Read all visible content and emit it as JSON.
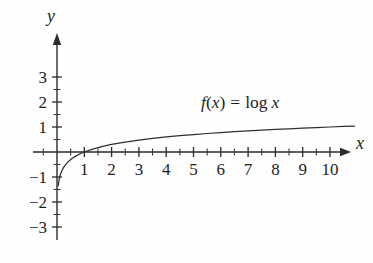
{
  "chart_data": {
    "type": "line",
    "title": "",
    "subtitle": "",
    "function_expression": "f(x) = log x",
    "function_label_parts": {
      "f": "f",
      "open_paren": "(",
      "var_in_paren": "x",
      "close_paren": ")",
      "equals": "=",
      "log": "log",
      "arg": "x"
    },
    "xlabel": "x",
    "ylabel": "y",
    "xlim": [
      -0.9,
      10.9
    ],
    "ylim": [
      -3.35,
      3.4
    ],
    "x_major_ticks": [
      1,
      2,
      3,
      4,
      5,
      6,
      7,
      8,
      9,
      10
    ],
    "x_tick_labels": [
      "1",
      "2",
      "3",
      "4",
      "5",
      "6",
      "7",
      "8",
      "9",
      "10"
    ],
    "x_minor_step": 0.5,
    "y_major_ticks": [
      -3,
      -2,
      -1,
      1,
      2,
      3
    ],
    "y_tick_labels": [
      "−3",
      "−2",
      "−1",
      "1",
      "2",
      "3"
    ],
    "y_minor_step": 0.5,
    "grid": false,
    "legend": null,
    "legend_position": "none",
    "axes_style": "arrowed-cartesian",
    "curve_color": "#2f2f2f",
    "axis_color": "#2b2b2b",
    "text_color": "#1d1d1d",
    "background_color": "#fefefe",
    "annotations": [
      {
        "text": "f(x) = log x",
        "x": 5.6,
        "y": 1.75
      }
    ],
    "x": [
      0.045,
      0.06,
      0.08,
      0.1,
      0.13,
      0.17,
      0.22,
      0.28,
      0.35,
      0.45,
      0.55,
      0.7,
      0.85,
      1.0,
      1.25,
      1.5,
      1.75,
      2.0,
      2.5,
      3.0,
      3.5,
      4.0,
      4.5,
      5.0,
      5.5,
      6.0,
      6.5,
      7.0,
      7.5,
      8.0,
      8.5,
      9.0,
      9.5,
      10.0,
      10.5,
      10.9
    ],
    "values": [
      -1.347,
      -1.222,
      -1.097,
      -1.0,
      -0.886,
      -0.77,
      -0.658,
      -0.553,
      -0.456,
      -0.347,
      -0.26,
      -0.155,
      -0.071,
      0.0,
      0.097,
      0.176,
      0.243,
      0.301,
      0.398,
      0.477,
      0.544,
      0.602,
      0.653,
      0.699,
      0.74,
      0.778,
      0.813,
      0.845,
      0.875,
      0.903,
      0.929,
      0.954,
      0.978,
      1.0,
      1.021,
      1.037
    ],
    "notes": {
      "x_intercept": 1,
      "value_at_10": 1.0,
      "asymptote": "x = 0 (vertical)",
      "base": 10
    }
  },
  "geometry": {
    "origin_px": {
      "x": 57,
      "y": 152
    },
    "unit_px": {
      "x": 27.3,
      "y": 25.0
    },
    "x_axis_px": {
      "x_start": 33,
      "x_end": 340
    },
    "y_axis_px": {
      "y_top": 40,
      "y_bottom": 240
    },
    "x_label_px": {
      "x": 356,
      "y": 149
    },
    "y_label_px": {
      "x": 51,
      "y": 22
    },
    "fn_label_px": {
      "x": 201,
      "y": 108
    },
    "tick_major_len": 5,
    "tick_minor_len": 3.5
  }
}
